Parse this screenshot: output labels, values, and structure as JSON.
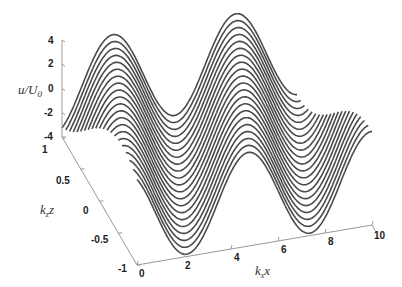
{
  "chart_data": {
    "type": "line3d",
    "title": "",
    "xlabel": "k_x x",
    "ylabel": "k_z z",
    "zlabel": "u/U_0",
    "x_ticks": [
      "0",
      "2",
      "4",
      "6",
      "8",
      "10"
    ],
    "y_ticks": [
      "-1",
      "-0.5",
      "0",
      "0.5",
      "1"
    ],
    "z_ticks": [
      "-4",
      "-2",
      "0",
      "2",
      "4"
    ],
    "xlim": [
      0,
      10
    ],
    "ylim": [
      -1,
      1
    ],
    "zlim": [
      -4,
      4
    ],
    "n_curves": 21,
    "series_formula": "u/U0 = A*cos(x - phase*z)",
    "amplitude": 3.8,
    "phase_per_unit_z": 1.6,
    "line_color": "#4a4a4a"
  },
  "labels": {
    "u_axis": "u/U",
    "u_axis_sub": "0",
    "z_axis": "k",
    "z_axis_sub": "z",
    "z_axis_var": "z",
    "x_axis": "k",
    "x_axis_sub": "x",
    "x_axis_var": "x"
  }
}
